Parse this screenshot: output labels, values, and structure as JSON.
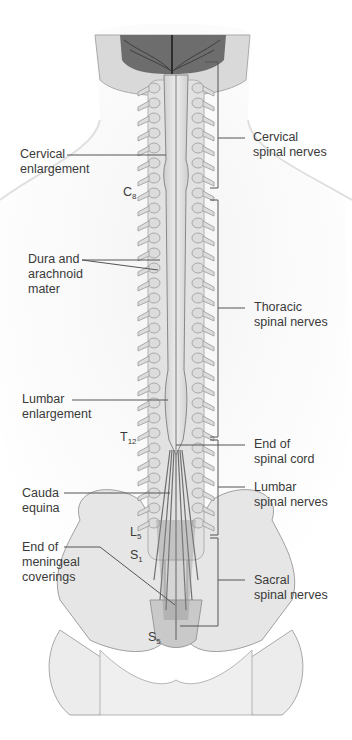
{
  "figure": {
    "colors": {
      "line": "#555555",
      "bone": "#e4e4e4",
      "bone_edge": "#9a9a9a",
      "brain": "#6a6a6a",
      "skin": "#f2f2f2",
      "text": "#3a3a3a"
    }
  },
  "labels_left": [
    {
      "id": "cervical-enlargement",
      "lines": [
        "Cervical",
        "enlargement"
      ]
    },
    {
      "id": "dura-arachnoid",
      "lines": [
        "Dura and",
        "arachnoid",
        "mater"
      ]
    },
    {
      "id": "lumbar-enlargement",
      "lines": [
        "Lumbar",
        "enlargement"
      ]
    },
    {
      "id": "cauda-equina",
      "lines": [
        "Cauda",
        "equina"
      ]
    },
    {
      "id": "end-meningeal",
      "lines": [
        "End of",
        "meningeal",
        "coverings"
      ]
    }
  ],
  "labels_right": [
    {
      "id": "cervical-nerves",
      "lines": [
        "Cervical",
        "spinal nerves"
      ]
    },
    {
      "id": "thoracic-nerves",
      "lines": [
        "Thoracic",
        "spinal nerves"
      ]
    },
    {
      "id": "end-spinal-cord",
      "lines": [
        "End of",
        "spinal cord"
      ]
    },
    {
      "id": "lumbar-nerves",
      "lines": [
        "Lumbar",
        "spinal nerves"
      ]
    },
    {
      "id": "sacral-nerves",
      "lines": [
        "Sacral",
        "spinal nerves"
      ]
    }
  ],
  "vertebra_markers": [
    {
      "letter": "C",
      "sub": "8"
    },
    {
      "letter": "T",
      "sub": "12"
    },
    {
      "letter": "L",
      "sub": "5"
    },
    {
      "letter": "S",
      "sub": "1"
    },
    {
      "letter": "S",
      "sub": "5"
    }
  ]
}
